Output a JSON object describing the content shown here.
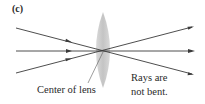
{
  "figure": {
    "panel_label": "(c)",
    "labels": {
      "center_of_lens": "Center of lens",
      "rays_line1": "Rays are",
      "rays_line2": "not bent."
    },
    "colors": {
      "lens": "#c8c8c8",
      "ray": "#3a3a3a",
      "text": "#2a2a2a"
    },
    "lens": {
      "cx": 103,
      "cy": 50,
      "half_width": 8,
      "half_height": 38
    },
    "rays": [
      {
        "name": "top-incoming-ray",
        "from": [
          16,
          28
        ],
        "to": [
          192,
          74
        ]
      },
      {
        "name": "middle-ray",
        "from": [
          16,
          51
        ],
        "to": [
          192,
          51
        ]
      },
      {
        "name": "bottom-incoming-ray",
        "from": [
          16,
          73
        ],
        "to": [
          192,
          27
        ]
      }
    ]
  }
}
